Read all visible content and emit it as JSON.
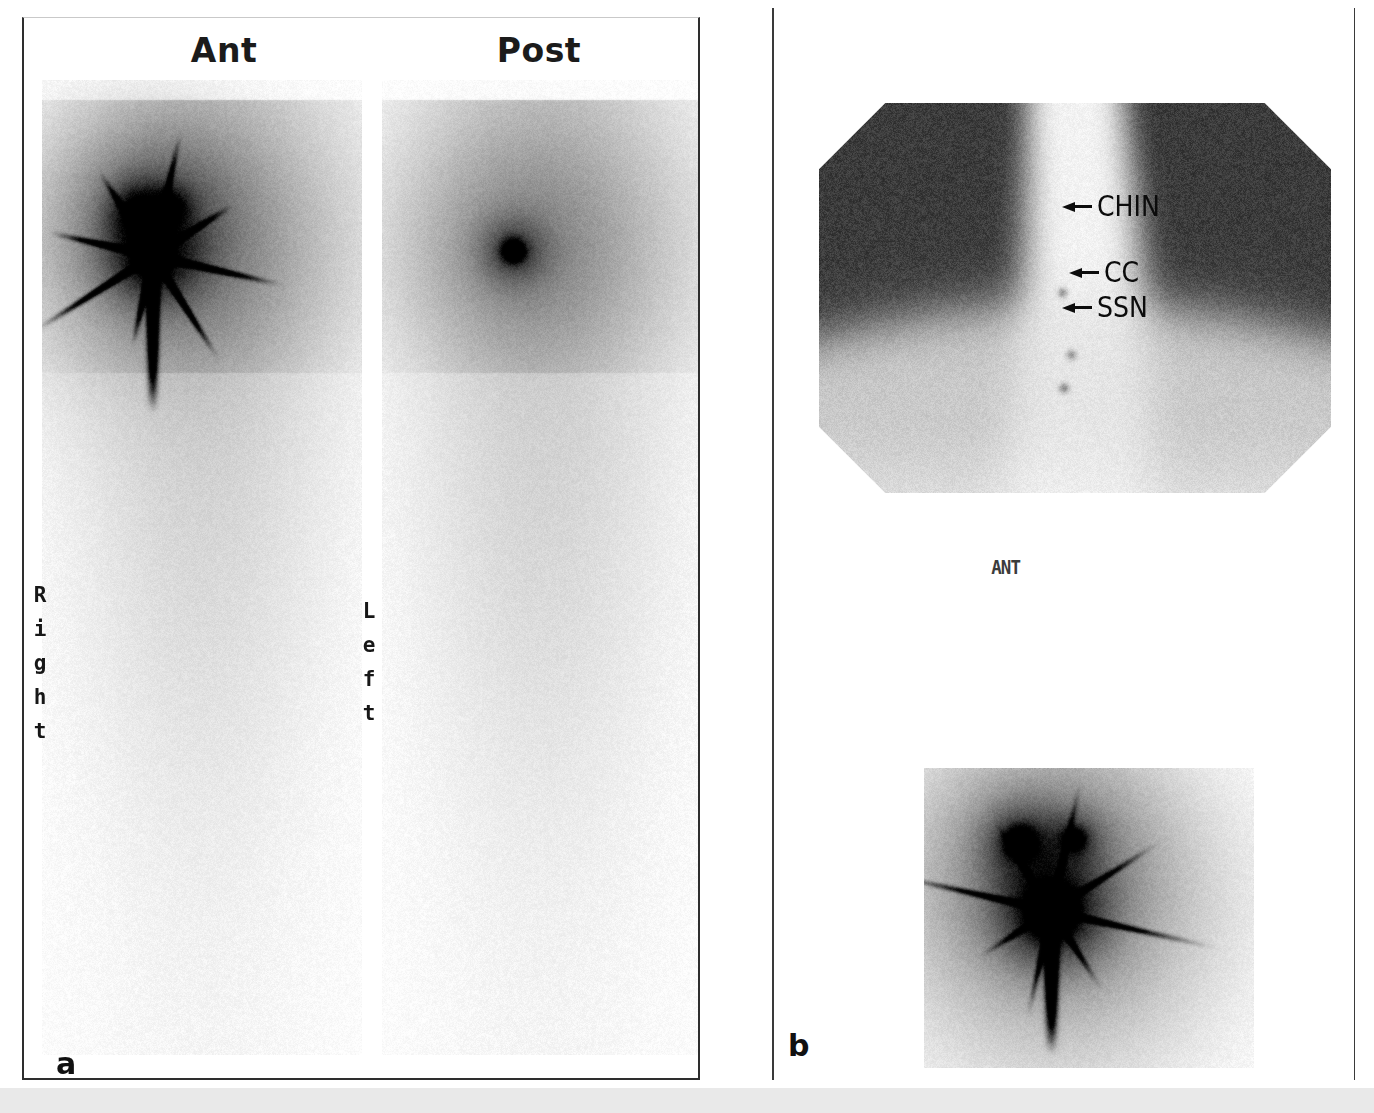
{
  "figure": {
    "type": "nuclear-medicine-lymphoscintigraphy",
    "bottom_band_color": "#e9e9e9"
  },
  "panel_a": {
    "letter": "a",
    "views": [
      {
        "key": "ant",
        "title": "Ant"
      },
      {
        "key": "post",
        "title": "Post"
      }
    ],
    "side_markers": {
      "right": {
        "text": "Right",
        "letters": [
          "R",
          "i",
          "g",
          "h",
          "t"
        ]
      },
      "left": {
        "text": "Left",
        "letters": [
          "L",
          "e",
          "f",
          "t"
        ]
      }
    },
    "border_color": "#2e2e2e"
  },
  "panel_b": {
    "letter": "b",
    "view_label": "ANT",
    "annotations": [
      {
        "id": "chin",
        "label": "CHIN",
        "icon": "arrow-left-icon"
      },
      {
        "id": "cc",
        "label": "CC",
        "icon": "arrow-left-icon"
      },
      {
        "id": "ssn",
        "label": "SSN",
        "icon": "arrow-left-icon"
      }
    ]
  },
  "chart_data": {
    "type": "heatmap",
    "colormap": "grayscale-inverted",
    "panels": [
      {
        "panel": "a",
        "images": [
          {
            "name": "anterior-scan",
            "view": "Ant",
            "orientation_markers": [
              "Right"
            ],
            "hotspots": [
              {
                "label": "left-upper-focus",
                "x_frac": 0.3,
                "y_frac": 0.135,
                "intensity": 0.88,
                "radius_frac": 0.035
              },
              {
                "label": "right-upper-focus",
                "x_frac": 0.4,
                "y_frac": 0.13,
                "intensity": 0.72,
                "radius_frac": 0.026
              },
              {
                "label": "injection-site",
                "x_frac": 0.345,
                "y_frac": 0.18,
                "intensity": 1.0,
                "radius_frac": 0.055
              }
            ],
            "star_artifact": true,
            "vertical_streak": {
              "x_frac": 0.345,
              "from_y_frac": 0.18,
              "to_y_frac": 0.34
            },
            "body_outline": {
              "x_frac": 0.5,
              "top_y_frac": 0.02,
              "width_frac": 0.92
            }
          },
          {
            "name": "posterior-scan",
            "view": "Post",
            "orientation_markers": [
              "Left"
            ],
            "hotspots": [
              {
                "label": "posterior-focus",
                "x_frac": 0.41,
                "y_frac": 0.175,
                "intensity": 0.62,
                "radius_frac": 0.042
              }
            ],
            "star_artifact": false,
            "body_outline": {
              "x_frac": 0.5,
              "top_y_frac": 0.02,
              "width_frac": 0.92
            }
          }
        ]
      },
      {
        "panel": "b",
        "images": [
          {
            "name": "transmission-scan",
            "view": "ANT",
            "shape": "octagonal-clipped",
            "regions": [
              {
                "label": "left-dark-field",
                "x_frac": 0.2,
                "y_frac": 0.3,
                "value": 0.62
              },
              {
                "label": "right-dark-field",
                "x_frac": 0.8,
                "y_frac": 0.3,
                "value": 0.62
              },
              {
                "label": "central-bright-column",
                "x_frac": 0.5,
                "y_frac": 0.4,
                "value": 0.07
              },
              {
                "label": "lower-bright-field",
                "x_frac": 0.5,
                "y_frac": 0.82,
                "value": 0.12
              }
            ],
            "markers": [
              {
                "label": "CHIN",
                "x_frac": 0.475,
                "y_frac": 0.485,
                "intensity": 0.45
              },
              {
                "label": "CC",
                "x_frac": 0.492,
                "y_frac": 0.645,
                "intensity": 0.42
              },
              {
                "label": "SSN",
                "x_frac": 0.478,
                "y_frac": 0.73,
                "intensity": 0.5
              }
            ]
          },
          {
            "name": "anterior-lymphoscintigram",
            "view": "ANT",
            "hotspots": [
              {
                "label": "left-node",
                "x_frac": 0.29,
                "y_frac": 0.245,
                "intensity": 0.55,
                "radius_frac": 0.05
              },
              {
                "label": "right-node",
                "x_frac": 0.455,
                "y_frac": 0.235,
                "intensity": 0.42,
                "radius_frac": 0.036
              },
              {
                "label": "injection-site",
                "x_frac": 0.385,
                "y_frac": 0.475,
                "intensity": 1.0,
                "radius_frac": 0.068
              }
            ],
            "vertical_streak": {
              "x_frac": 0.385,
              "from_y_frac": 0.5,
              "to_y_frac": 0.95
            }
          }
        ]
      }
    ]
  }
}
